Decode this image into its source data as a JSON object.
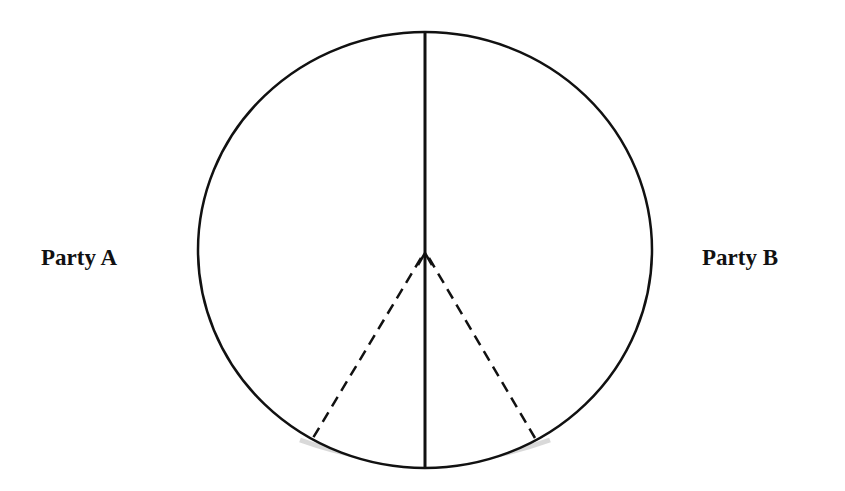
{
  "diagram": {
    "type": "circle-division",
    "labels": {
      "left": "Party A",
      "right": "Party B"
    },
    "elements": {
      "circle": {
        "cx": 425,
        "cy": 250,
        "rx": 227,
        "ry": 218,
        "stroke": "#111111"
      },
      "divider_line": {
        "x1": 425,
        "y1": 32,
        "x2": 425,
        "y2": 467,
        "style": "solid"
      },
      "dashed_lines": [
        {
          "x1": 425,
          "y1": 253,
          "x2": 313,
          "y2": 438,
          "style": "dashed"
        },
        {
          "x1": 425,
          "y1": 253,
          "x2": 535,
          "y2": 438,
          "style": "dashed"
        }
      ],
      "apex": {
        "x": 425,
        "y": 253
      }
    },
    "colors": {
      "line": "#111111",
      "shadow": "#c8c8c8",
      "background": "#ffffff"
    }
  }
}
